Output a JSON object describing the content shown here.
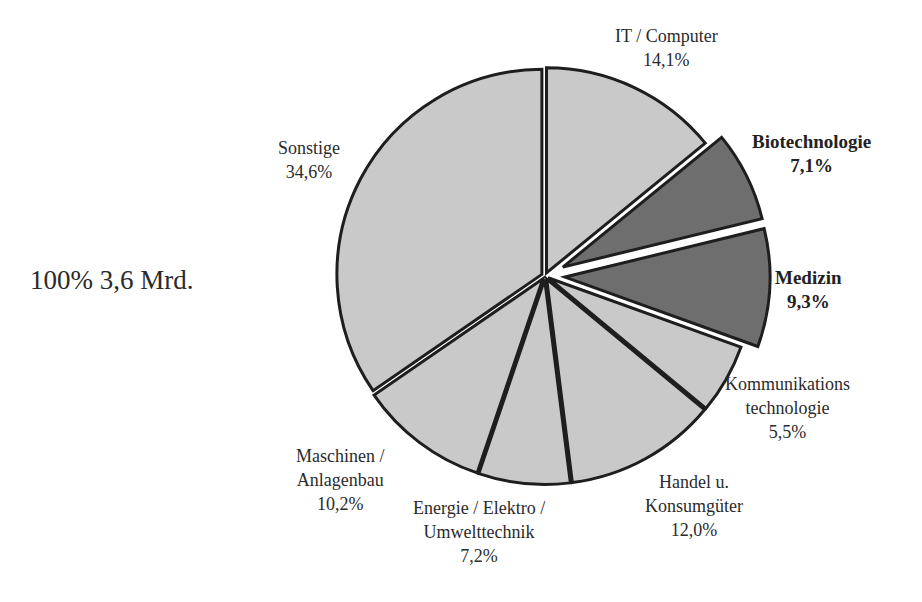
{
  "chart_data": {
    "type": "pie",
    "title": "",
    "total_label": "100%  3,6 Mrd.",
    "start_angle_deg": 0,
    "direction": "clockwise",
    "slices": [
      {
        "name": "IT  / Computer",
        "lines": [
          "IT  / Computer",
          "14,1%"
        ],
        "value": 14.1,
        "fill": "#c9c9c9",
        "exploded": false,
        "bold": false
      },
      {
        "name": "Biotechnologie",
        "lines": [
          "Biotechnologie",
          "7,1%"
        ],
        "value": 7.1,
        "fill": "#6e6e6e",
        "exploded": true,
        "bold": true
      },
      {
        "name": "Medizin",
        "lines": [
          "Medizin",
          "9,3%"
        ],
        "value": 9.3,
        "fill": "#6e6e6e",
        "exploded": true,
        "bold": true
      },
      {
        "name": "Kommunikations technologie",
        "lines": [
          "Kommunikations",
          "technologie",
          "5,5%"
        ],
        "value": 5.5,
        "fill": "#c9c9c9",
        "exploded": false,
        "bold": false
      },
      {
        "name": "Handel u. Konsumgüter",
        "lines": [
          "Handel u.",
          "Konsumgüter",
          "12,0%"
        ],
        "value": 12.0,
        "fill": "#c9c9c9",
        "exploded": false,
        "bold": false
      },
      {
        "name": "Energie / Elektro / Umwelttechnik",
        "lines": [
          "Energie / Elektro /",
          "Umwelttechnik",
          "7,2%"
        ],
        "value": 7.2,
        "fill": "#c9c9c9",
        "exploded": false,
        "bold": false
      },
      {
        "name": "Maschinen / Anlagenbau",
        "lines": [
          "Maschinen /",
          "Anlagenbau",
          "10,2%"
        ],
        "value": 10.2,
        "fill": "#c9c9c9",
        "exploded": false,
        "bold": false
      },
      {
        "name": "Sonstige",
        "lines": [
          "Sonstige",
          "34,6%"
        ],
        "value": 34.6,
        "fill": "#c9c9c9",
        "exploded": false,
        "bold": false
      }
    ],
    "legend": "none"
  },
  "labels": {
    "total": "100%  3,6 Mrd.",
    "it": [
      "IT  / Computer",
      "14,1%"
    ],
    "bio": [
      "Biotechnologie",
      "7,1%"
    ],
    "med": [
      "Medizin",
      "9,3%"
    ],
    "kom": [
      "Kommunikations",
      "technologie",
      "5,5%"
    ],
    "han": [
      "Handel u.",
      "Konsumgüter",
      "12,0%"
    ],
    "ene": [
      "Energie / Elektro /",
      "Umwelttechnik",
      "7,2%"
    ],
    "mas": [
      "Maschinen /",
      "Anlagenbau",
      "10,2%"
    ],
    "son": [
      "Sonstige",
      "34,6%"
    ]
  }
}
